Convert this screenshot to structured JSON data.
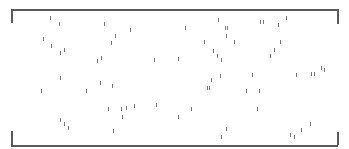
{
  "frame": {
    "border_color": "#5a5a5a",
    "tick_color": "#7a7a7a",
    "top_line": {
      "x1": 11,
      "x2": 338,
      "y": 9
    },
    "bottom_line": {
      "x1": 11,
      "x2": 338,
      "y": 145
    },
    "top_left_bracket": {
      "x": 11,
      "y1": 9,
      "y2": 23
    },
    "top_right_bracket": {
      "x": 337,
      "y1": 9,
      "y2": 24
    },
    "bottom_left_bracket": {
      "x": 11,
      "y1": 131,
      "y2": 145
    },
    "bottom_right_bracket": {
      "x": 337,
      "y1": 132,
      "y2": 145
    }
  },
  "ticks": [
    {
      "x": 50,
      "y": 16
    },
    {
      "x": 59,
      "y": 22
    },
    {
      "x": 104,
      "y": 22
    },
    {
      "x": 43,
      "y": 37
    },
    {
      "x": 51,
      "y": 44
    },
    {
      "x": 60,
      "y": 51
    },
    {
      "x": 64,
      "y": 48
    },
    {
      "x": 97,
      "y": 59
    },
    {
      "x": 101,
      "y": 56
    },
    {
      "x": 130,
      "y": 28
    },
    {
      "x": 115,
      "y": 34
    },
    {
      "x": 111,
      "y": 41
    },
    {
      "x": 154,
      "y": 58
    },
    {
      "x": 185,
      "y": 26
    },
    {
      "x": 218,
      "y": 18
    },
    {
      "x": 225,
      "y": 26
    },
    {
      "x": 227,
      "y": 26
    },
    {
      "x": 226,
      "y": 34
    },
    {
      "x": 204,
      "y": 40
    },
    {
      "x": 234,
      "y": 40
    },
    {
      "x": 260,
      "y": 20
    },
    {
      "x": 263,
      "y": 20
    },
    {
      "x": 278,
      "y": 23
    },
    {
      "x": 286,
      "y": 16
    },
    {
      "x": 280,
      "y": 40
    },
    {
      "x": 213,
      "y": 49
    },
    {
      "x": 217,
      "y": 54
    },
    {
      "x": 221,
      "y": 58
    },
    {
      "x": 178,
      "y": 57
    },
    {
      "x": 274,
      "y": 48
    },
    {
      "x": 270,
      "y": 54
    },
    {
      "x": 321,
      "y": 66
    },
    {
      "x": 324,
      "y": 68
    },
    {
      "x": 314,
      "y": 72
    },
    {
      "x": 311,
      "y": 72
    },
    {
      "x": 296,
      "y": 73
    },
    {
      "x": 252,
      "y": 73
    },
    {
      "x": 220,
      "y": 74
    },
    {
      "x": 60,
      "y": 76
    },
    {
      "x": 41,
      "y": 89
    },
    {
      "x": 86,
      "y": 89
    },
    {
      "x": 100,
      "y": 81
    },
    {
      "x": 112,
      "y": 84
    },
    {
      "x": 108,
      "y": 107
    },
    {
      "x": 121,
      "y": 107
    },
    {
      "x": 126,
      "y": 106
    },
    {
      "x": 134,
      "y": 104
    },
    {
      "x": 156,
      "y": 103
    },
    {
      "x": 122,
      "y": 115
    },
    {
      "x": 60,
      "y": 118
    },
    {
      "x": 64,
      "y": 122
    },
    {
      "x": 68,
      "y": 126
    },
    {
      "x": 113,
      "y": 129
    },
    {
      "x": 211,
      "y": 78
    },
    {
      "x": 207,
      "y": 86
    },
    {
      "x": 209,
      "y": 86
    },
    {
      "x": 246,
      "y": 89
    },
    {
      "x": 259,
      "y": 89
    },
    {
      "x": 178,
      "y": 115
    },
    {
      "x": 191,
      "y": 107
    },
    {
      "x": 257,
      "y": 107
    },
    {
      "x": 310,
      "y": 122
    },
    {
      "x": 301,
      "y": 128
    },
    {
      "x": 290,
      "y": 133
    },
    {
      "x": 294,
      "y": 135
    },
    {
      "x": 226,
      "y": 127
    },
    {
      "x": 221,
      "y": 135
    }
  ]
}
